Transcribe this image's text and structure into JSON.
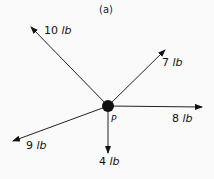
{
  "figure": {
    "title": "(a)",
    "point": {
      "label": "P",
      "x": 108,
      "y": 106
    },
    "forces": [
      {
        "name": "10-lb",
        "magnitude": "10",
        "unit": "lb",
        "end": [
          31,
          27
        ],
        "label_pos": [
          44,
          24
        ]
      },
      {
        "name": "7-lb",
        "magnitude": "7",
        "unit": "lb",
        "end": [
          165,
          50
        ],
        "label_pos": [
          162,
          56
        ]
      },
      {
        "name": "8-lb",
        "magnitude": "8",
        "unit": "lb",
        "end": [
          202,
          107
        ],
        "label_pos": [
          172,
          112
        ]
      },
      {
        "name": "9-lb",
        "magnitude": "9",
        "unit": "lb",
        "end": [
          13,
          141
        ],
        "label_pos": [
          26,
          139
        ]
      },
      {
        "name": "4-lb",
        "magnitude": "4",
        "unit": "lb",
        "end": [
          108,
          153
        ],
        "label_pos": [
          99,
          155
        ]
      }
    ]
  }
}
